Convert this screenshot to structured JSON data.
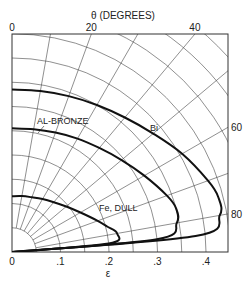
{
  "chart_data": {
    "type": "line",
    "subtype": "polar-quadrant",
    "title": "",
    "top_axis_label": "θ (DEGREES)",
    "xlabel": "ε",
    "theta_ticks": [
      {
        "value": 0,
        "label": "0"
      },
      {
        "value": 20,
        "label": "20"
      },
      {
        "value": 40,
        "label": "40"
      },
      {
        "value": 60,
        "label": "60"
      },
      {
        "value": 80,
        "label": "80"
      }
    ],
    "r_ticks": [
      {
        "value": 0,
        "label": "0"
      },
      {
        "value": 0.1,
        "label": ".1"
      },
      {
        "value": 0.2,
        "label": ".2"
      },
      {
        "value": 0.3,
        "label": ".3"
      },
      {
        "value": 0.4,
        "label": ".4"
      }
    ],
    "r_range": [
      0,
      0.45
    ],
    "grid": {
      "theta_step_deg": 10,
      "r_step": 0.05
    },
    "theta_unit": "degrees from normal (vertical)",
    "series": [
      {
        "name": "Bi",
        "theta": [
          0,
          10,
          20,
          30,
          40,
          50,
          60,
          70,
          75,
          80,
          85,
          90
        ],
        "r": [
          0.335,
          0.337,
          0.342,
          0.35,
          0.362,
          0.38,
          0.405,
          0.43,
          0.44,
          0.435,
          0.38,
          0.0
        ]
      },
      {
        "name": "AL-BRONZE",
        "theta": [
          0,
          10,
          20,
          30,
          40,
          50,
          60,
          70,
          75,
          80,
          85,
          90
        ],
        "r": [
          0.255,
          0.257,
          0.262,
          0.27,
          0.28,
          0.295,
          0.315,
          0.34,
          0.35,
          0.345,
          0.3,
          0.0
        ]
      },
      {
        "name": "Fe, DULL",
        "theta": [
          0,
          10,
          20,
          30,
          40,
          50,
          60,
          70,
          75,
          80,
          85,
          90
        ],
        "r": [
          0.115,
          0.117,
          0.12,
          0.126,
          0.134,
          0.146,
          0.163,
          0.188,
          0.203,
          0.22,
          0.2,
          0.0
        ]
      }
    ],
    "annotations": [
      {
        "text": "AL-BRONZE",
        "series": "AL-BRONZE"
      },
      {
        "text": "Bi",
        "series": "Bi"
      },
      {
        "text": "Fe, DULL",
        "series": "Fe, DULL"
      }
    ]
  }
}
